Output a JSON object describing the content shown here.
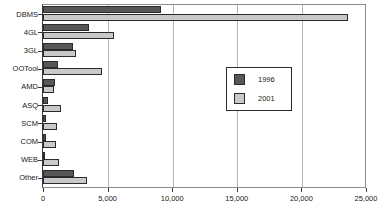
{
  "chart_data": {
    "type": "bar",
    "orientation": "horizontal",
    "title": "",
    "subtitle": "",
    "xlabel": "",
    "ylabel": "",
    "xlim": [
      0,
      25000
    ],
    "grid": true,
    "grid_axis": "x",
    "legend_position": "center-right",
    "categories": [
      "DBMS",
      "4GL",
      "3GL",
      "OOTool",
      "AMD",
      "ASQ",
      "SCM",
      "COM",
      "WEB",
      "Other"
    ],
    "xticks": [
      0,
      5000,
      10000,
      15000,
      20000,
      25000
    ],
    "xticklabels": [
      "0",
      "5,000",
      "10,000",
      "15,000",
      "20,000",
      "25,000"
    ],
    "series": [
      {
        "name": "1996",
        "color": "#575757",
        "values": [
          9100,
          3550,
          2300,
          1150,
          900,
          400,
          250,
          240,
          150,
          2400
        ]
      },
      {
        "name": "2001",
        "color": "#c9c9c9",
        "values": [
          23600,
          5480,
          2550,
          4550,
          850,
          1400,
          1100,
          1000,
          1200,
          3400
        ]
      }
    ]
  },
  "legend": {
    "entries": [
      {
        "label": "1996"
      },
      {
        "label": "2001"
      }
    ]
  }
}
